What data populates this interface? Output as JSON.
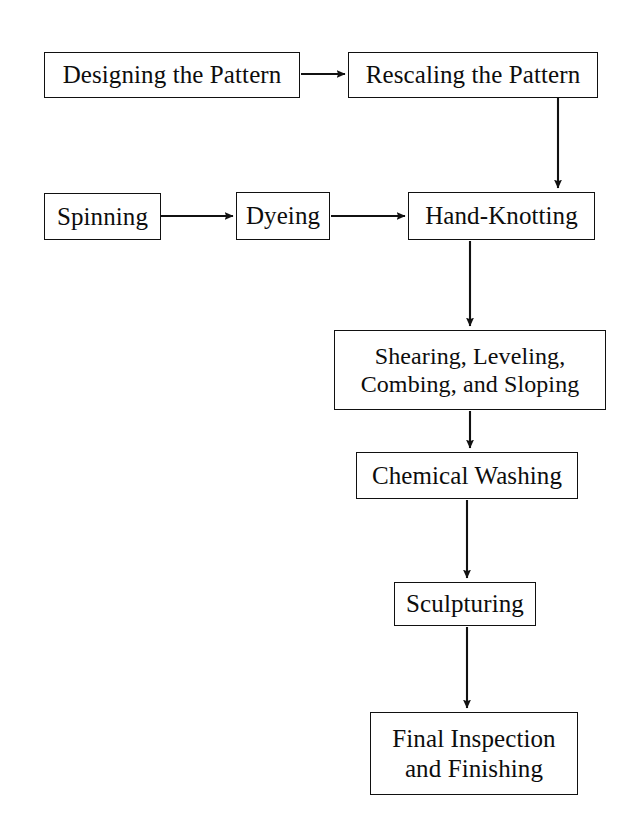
{
  "diagram": {
    "background_color": "#ffffff",
    "line_color": "#111111",
    "text_color": "#0d0d0d",
    "nodes": [
      {
        "id": "designing",
        "label": "Designing the Pattern"
      },
      {
        "id": "rescaling",
        "label": "Rescaling the Pattern"
      },
      {
        "id": "spinning",
        "label": "Spinning"
      },
      {
        "id": "dyeing",
        "label": "Dyeing"
      },
      {
        "id": "handknot",
        "label": "Hand-Knotting"
      },
      {
        "id": "shearing",
        "label": "Shearing, Leveling,\nCombing, and Sloping"
      },
      {
        "id": "chemwash",
        "label": "Chemical Washing"
      },
      {
        "id": "sculpturing",
        "label": "Sculpturing"
      },
      {
        "id": "final",
        "label": "Final Inspection\nand Finishing"
      }
    ],
    "edges": [
      {
        "from": "designing",
        "to": "rescaling",
        "direction": "right"
      },
      {
        "from": "rescaling",
        "to": "handknot",
        "direction": "down"
      },
      {
        "from": "spinning",
        "to": "dyeing",
        "direction": "right"
      },
      {
        "from": "dyeing",
        "to": "handknot",
        "direction": "right"
      },
      {
        "from": "handknot",
        "to": "shearing",
        "direction": "down"
      },
      {
        "from": "shearing",
        "to": "chemwash",
        "direction": "down"
      },
      {
        "from": "chemwash",
        "to": "sculpturing",
        "direction": "down"
      },
      {
        "from": "sculpturing",
        "to": "final",
        "direction": "down"
      }
    ]
  }
}
